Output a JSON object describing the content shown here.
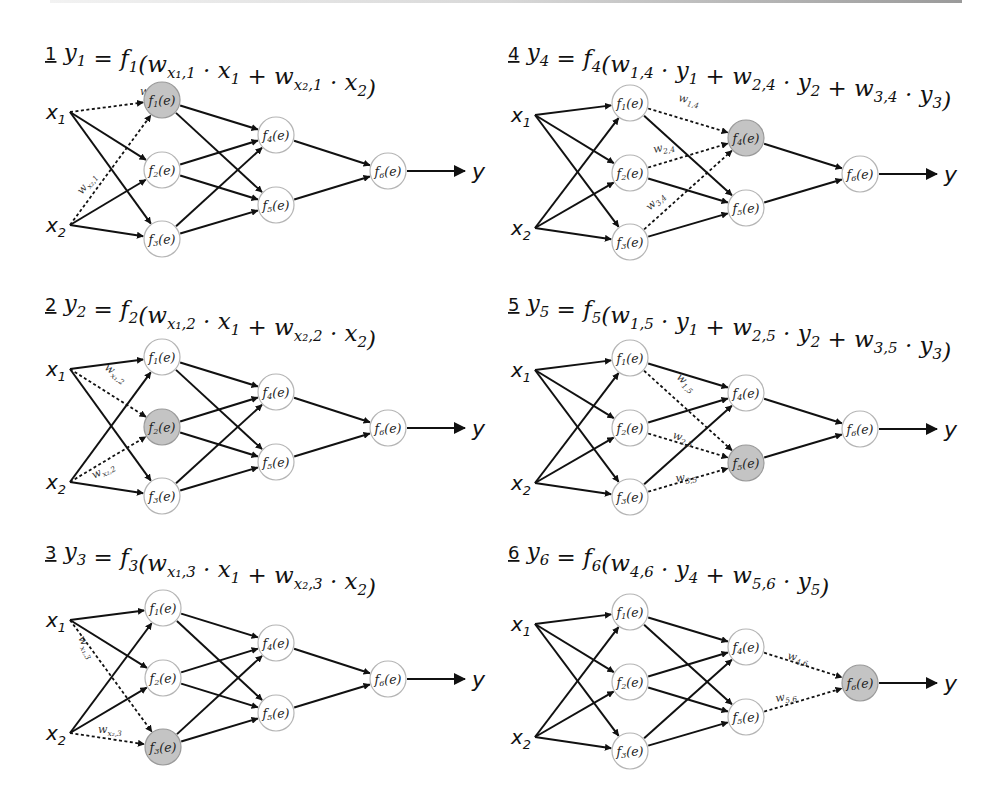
{
  "colors": {
    "ink": "#111111",
    "node_stroke": "#b5b5b5",
    "node_fill": "#ffffff",
    "active_fill": "#c4c4c4"
  },
  "network": {
    "inputs": [
      {
        "id": "x1",
        "base": "x",
        "sub": "1"
      },
      {
        "id": "x2",
        "base": "x",
        "sub": "2"
      }
    ],
    "nodes": [
      {
        "id": "f1",
        "label_pre": "f",
        "sub": "1",
        "label_post": "(e)"
      },
      {
        "id": "f2",
        "label_pre": "f",
        "sub": "2",
        "label_post": "(e)"
      },
      {
        "id": "f3",
        "label_pre": "f",
        "sub": "3",
        "label_post": "(e)"
      },
      {
        "id": "f4",
        "label_pre": "f",
        "sub": "4",
        "label_post": "(e)"
      },
      {
        "id": "f5",
        "label_pre": "f",
        "sub": "5",
        "label_post": "(e)"
      },
      {
        "id": "f6",
        "label_pre": "f",
        "sub": "6",
        "label_post": "(e)"
      }
    ],
    "output_label": "y",
    "edges": [
      [
        "x1",
        "f1"
      ],
      [
        "x1",
        "f2"
      ],
      [
        "x1",
        "f3"
      ],
      [
        "x2",
        "f1"
      ],
      [
        "x2",
        "f2"
      ],
      [
        "x2",
        "f3"
      ],
      [
        "f1",
        "f4"
      ],
      [
        "f1",
        "f5"
      ],
      [
        "f2",
        "f4"
      ],
      [
        "f2",
        "f5"
      ],
      [
        "f3",
        "f4"
      ],
      [
        "f3",
        "f5"
      ],
      [
        "f4",
        "f6"
      ],
      [
        "f5",
        "f6"
      ]
    ]
  },
  "panels": [
    {
      "step": "1",
      "title": {
        "lhs": "y",
        "lhs_sub": "1",
        "rhs": "= f₁(w",
        "full": "y1 = f1(w_{x1,1} · x1 + w_{x2,1} · x2)"
      },
      "title_parts": [
        [
          "y",
          "1"
        ],
        [
          " = f",
          "1"
        ],
        [
          "(w",
          "x₁,1"
        ],
        [
          " · x",
          "1"
        ],
        [
          " + w",
          "x₂,1"
        ],
        [
          " · x",
          "2"
        ],
        [
          ")",
          ""
        ]
      ],
      "active": "f1",
      "dashed": [
        {
          "from": "x1",
          "to": "f1",
          "w": "w",
          "wsub": "x₁,1",
          "lx": 140,
          "ly": -5,
          "rot": 0
        },
        {
          "from": "x2",
          "to": "f1",
          "w": "w",
          "wsub": "x₂,1",
          "lx": 82,
          "ly": 95,
          "rot": -52
        }
      ]
    },
    {
      "step": "2",
      "title": {
        "full": "y2 = f2(w_{x1,2} · x1 + w_{x2,2} · x2)"
      },
      "title_parts": [
        [
          "y",
          "2"
        ],
        [
          " = f",
          "2"
        ],
        [
          "(w",
          "x₁,2"
        ],
        [
          " · x",
          "1"
        ],
        [
          " + w",
          "x₂,2"
        ],
        [
          " · x",
          "2"
        ],
        [
          ")",
          ""
        ]
      ],
      "active": "f2",
      "dashed": [
        {
          "from": "x1",
          "to": "f2",
          "w": "w",
          "wsub": "x₁,2",
          "lx": 104,
          "ly": 12,
          "rot": 35
        },
        {
          "from": "x2",
          "to": "f2",
          "w": "w",
          "wsub": "x₂,2",
          "lx": 94,
          "ly": 122,
          "rot": -28
        }
      ]
    },
    {
      "step": "3",
      "title": {
        "full": "y3 = f3(w_{x1,3} · x1 + w_{x2,3} · x2)"
      },
      "title_parts": [
        [
          "y",
          "3"
        ],
        [
          " = f",
          "3"
        ],
        [
          "(w",
          "x₁,3"
        ],
        [
          " · x",
          "1"
        ],
        [
          " + w",
          "x₂,3"
        ],
        [
          " · x",
          "2"
        ],
        [
          ")",
          ""
        ]
      ],
      "active": "f3",
      "dashed": [
        {
          "from": "x1",
          "to": "f3",
          "w": "w",
          "wsub": "x₁,3",
          "lx": 78,
          "ly": 30,
          "rot": 62
        },
        {
          "from": "x2",
          "to": "f3",
          "w": "w",
          "wsub": "x₂,3",
          "lx": 98,
          "ly": 125,
          "rot": 0
        }
      ]
    },
    {
      "step": "4",
      "title": {
        "full": "y4 = f4(w_{1,4} · y1 + w_{2,4} · y2 + w_{3,4} · y3)"
      },
      "title_parts": [
        [
          "y",
          "4"
        ],
        [
          " = f",
          "4"
        ],
        [
          "(w",
          "1,4"
        ],
        [
          " · y",
          "1"
        ],
        [
          " + w",
          "2,4"
        ],
        [
          " · y",
          "2"
        ],
        [
          " + w",
          "3,4"
        ],
        [
          " · y",
          "3"
        ],
        [
          ")",
          ""
        ]
      ],
      "active": "f4",
      "dashed": [
        {
          "from": "f1",
          "to": "f4",
          "w": "w",
          "wsub": "1,4",
          "lx": 678,
          "ly": -2,
          "rot": 12
        },
        {
          "from": "f2",
          "to": "f4",
          "w": "w",
          "wsub": "2,4",
          "lx": 654,
          "ly": 50,
          "rot": -12
        },
        {
          "from": "f3",
          "to": "f4",
          "w": "w",
          "wsub": "3,4",
          "lx": 650,
          "ly": 108,
          "rot": -45
        }
      ]
    },
    {
      "step": "5",
      "title": {
        "full": "y5 = f5(w_{1,5} · y1 + w_{2,5} · y2 + w_{3,5} · y3)"
      },
      "title_parts": [
        [
          "y",
          "5"
        ],
        [
          " = f",
          "5"
        ],
        [
          "(w",
          "1,5"
        ],
        [
          " · y",
          "1"
        ],
        [
          " + w",
          "2,5"
        ],
        [
          " · y",
          "2"
        ],
        [
          " + w",
          "3,5"
        ],
        [
          " · y",
          "3"
        ],
        [
          ")",
          ""
        ]
      ],
      "active": "f5",
      "dashed": [
        {
          "from": "f1",
          "to": "f5",
          "w": "w",
          "wsub": "1,5",
          "lx": 676,
          "ly": 20,
          "rot": 42
        },
        {
          "from": "f2",
          "to": "f5",
          "w": "w",
          "wsub": "2,5",
          "lx": 672,
          "ly": 80,
          "rot": 18
        },
        {
          "from": "f3",
          "to": "f5",
          "w": "w",
          "wsub": "3,5",
          "lx": 676,
          "ly": 124,
          "rot": -8
        }
      ]
    },
    {
      "step": "6",
      "title": {
        "full": "y6 = f6(w_{4,6} · y4 + w_{5,6} · y5)"
      },
      "title_parts": [
        [
          "y",
          "6"
        ],
        [
          " = f",
          "6"
        ],
        [
          "(w",
          "4,6"
        ],
        [
          " · y",
          "4"
        ],
        [
          " + w",
          "5,6"
        ],
        [
          " · y",
          "5"
        ],
        [
          ")",
          ""
        ]
      ],
      "active": "f6",
      "dashed": [
        {
          "from": "f4",
          "to": "f6",
          "w": "w",
          "wsub": "4,6",
          "lx": 787,
          "ly": 47,
          "rot": 12
        },
        {
          "from": "f5",
          "to": "f6",
          "w": "w",
          "wsub": "5,6",
          "lx": 776,
          "ly": 90,
          "rot": -10
        }
      ]
    }
  ]
}
